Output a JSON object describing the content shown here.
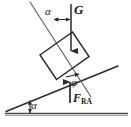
{
  "figure": {
    "type": "free-body-diagram",
    "canvas": {
      "width": 131,
      "height": 127,
      "background": "#ffffff"
    },
    "colors": {
      "line": "#2b2b2b",
      "ground": "#555555",
      "text": "#1a1a1a",
      "background": "#ffffff"
    },
    "labels": {
      "alpha_top": "α",
      "alpha_base": "α",
      "weight_vector": "G",
      "phi": "φ",
      "reaction_force": "F",
      "reaction_force_subscript": "RA"
    },
    "geometry": {
      "incline_angle_deg": 22,
      "ground_line": {
        "x1": 5,
        "y1": 113,
        "x2": 128,
        "y2": 113
      },
      "incline_line": {
        "x1": 6,
        "y1": 111,
        "x2": 118,
        "y2": 65
      },
      "normal_line": {
        "x1": 30,
        "y1": 2,
        "x2": 91,
        "y2": 97
      },
      "block": {
        "corners": [
          [
            40,
            55
          ],
          [
            72,
            32
          ],
          [
            89,
            57
          ],
          [
            57,
            80
          ]
        ]
      },
      "weight_arrow": {
        "x1": 71,
        "y1": 4,
        "x2": 71,
        "y2": 57,
        "direction": "down"
      },
      "reaction_arrow": {
        "x1": 70,
        "y1": 103,
        "x2": 70,
        "y2": 76,
        "direction": "up"
      },
      "alpha_top_arc": {
        "cx": 71,
        "cy": 4,
        "radius": 22,
        "from_deg": 90,
        "to_deg": 123
      },
      "alpha_base_arc": {
        "cx": 6,
        "cy": 111,
        "radius": 28,
        "from_deg": 0,
        "to_deg": 22
      },
      "phi_arc": {
        "cx": 70,
        "cy": 76,
        "radius": 10,
        "from_deg": 60,
        "to_deg": 90
      }
    }
  }
}
